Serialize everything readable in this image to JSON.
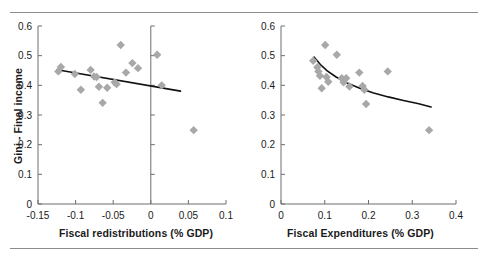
{
  "figure": {
    "name": "two-panel-scatter-figure",
    "marker_color": "#a8a8a8",
    "trendline_color": "#111111",
    "axis_color": "#6e6e6e",
    "rule_color": "#8c8c8c"
  },
  "chart_data": [
    {
      "type": "scatter",
      "panel": "left",
      "title": "",
      "xlabel": "Fiscal redistributions (% GDP)",
      "ylabel": "Gini - Final income",
      "xlim": [
        -0.15,
        0.1
      ],
      "ylim": [
        0,
        0.6
      ],
      "xticks": [
        -0.15,
        -0.1,
        -0.05,
        0,
        0.05,
        0.1
      ],
      "xticklabels": [
        "-0.15",
        "-0.1",
        "-0.05",
        "0",
        "0.05",
        "0.1"
      ],
      "yticks": [
        0,
        0.1,
        0.2,
        0.3,
        0.4,
        0.5,
        0.6
      ],
      "yticklabels": [
        "0",
        "0.1",
        "0.2",
        "0.3",
        "0.4",
        "0.5",
        "0.6"
      ],
      "grid": false,
      "legend": "none",
      "vertical_axis_at_x": 0,
      "points": [
        {
          "x": -0.123,
          "y": 0.447
        },
        {
          "x": -0.1195,
          "y": 0.462
        },
        {
          "x": -0.101,
          "y": 0.438
        },
        {
          "x": -0.093,
          "y": 0.385
        },
        {
          "x": -0.08,
          "y": 0.452
        },
        {
          "x": -0.0755,
          "y": 0.43
        },
        {
          "x": -0.072,
          "y": 0.428
        },
        {
          "x": -0.069,
          "y": 0.395
        },
        {
          "x": -0.064,
          "y": 0.341
        },
        {
          "x": -0.058,
          "y": 0.392
        },
        {
          "x": -0.048,
          "y": 0.41
        },
        {
          "x": -0.0455,
          "y": 0.404
        },
        {
          "x": -0.04,
          "y": 0.536
        },
        {
          "x": -0.033,
          "y": 0.443
        },
        {
          "x": -0.0245,
          "y": 0.475
        },
        {
          "x": -0.017,
          "y": 0.458
        },
        {
          "x": 0.0085,
          "y": 0.503
        },
        {
          "x": 0.0145,
          "y": 0.4
        },
        {
          "x": 0.057,
          "y": 0.249
        }
      ],
      "trendline": {
        "fit": "linear",
        "points": [
          {
            "x": -0.1245,
            "y": 0.4525
          },
          {
            "x": 0.0395,
            "y": 0.3805
          }
        ]
      }
    },
    {
      "type": "scatter",
      "panel": "right",
      "title": "",
      "xlabel": "Fiscal Expenditures (% GDP)",
      "ylabel": "",
      "xlim": [
        0,
        0.4
      ],
      "ylim": [
        0,
        0.6
      ],
      "xticks": [
        0,
        0.1,
        0.2,
        0.3,
        0.4
      ],
      "xticklabels": [
        "0",
        "0.1",
        "0.2",
        "0.3",
        "0.4"
      ],
      "yticks": [
        0,
        0.1,
        0.2,
        0.3,
        0.4,
        0.5,
        0.6
      ],
      "yticklabels": [
        "0",
        "0.1",
        "0.2",
        "0.3",
        "0.4",
        "0.5",
        "0.6"
      ],
      "grid": false,
      "legend": "none",
      "points": [
        {
          "x": 0.0735,
          "y": 0.483
        },
        {
          "x": 0.083,
          "y": 0.461
        },
        {
          "x": 0.0855,
          "y": 0.447
        },
        {
          "x": 0.089,
          "y": 0.432
        },
        {
          "x": 0.093,
          "y": 0.39
        },
        {
          "x": 0.101,
          "y": 0.536
        },
        {
          "x": 0.104,
          "y": 0.428
        },
        {
          "x": 0.108,
          "y": 0.412
        },
        {
          "x": 0.1275,
          "y": 0.503
        },
        {
          "x": 0.139,
          "y": 0.424
        },
        {
          "x": 0.143,
          "y": 0.41
        },
        {
          "x": 0.149,
          "y": 0.424
        },
        {
          "x": 0.1565,
          "y": 0.396
        },
        {
          "x": 0.179,
          "y": 0.443
        },
        {
          "x": 0.1865,
          "y": 0.398
        },
        {
          "x": 0.1905,
          "y": 0.385
        },
        {
          "x": 0.1945,
          "y": 0.337
        },
        {
          "x": 0.244,
          "y": 0.447
        },
        {
          "x": 0.3385,
          "y": 0.249
        }
      ],
      "trendline": {
        "fit": "power",
        "points": [
          {
            "x": 0.0755,
            "y": 0.4955
          },
          {
            "x": 0.09,
            "y": 0.47
          },
          {
            "x": 0.105,
            "y": 0.4495
          },
          {
            "x": 0.125,
            "y": 0.429
          },
          {
            "x": 0.15,
            "y": 0.409
          },
          {
            "x": 0.18,
            "y": 0.39
          },
          {
            "x": 0.21,
            "y": 0.375
          },
          {
            "x": 0.245,
            "y": 0.361
          },
          {
            "x": 0.28,
            "y": 0.349
          },
          {
            "x": 0.315,
            "y": 0.338
          },
          {
            "x": 0.343,
            "y": 0.327
          }
        ]
      }
    }
  ]
}
